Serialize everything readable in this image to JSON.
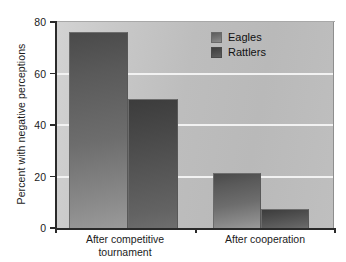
{
  "chart_data": {
    "type": "bar",
    "title": "",
    "xlabel": "",
    "ylabel": "Percent with negative perceptions",
    "ylim": [
      0,
      80
    ],
    "yticks": [
      0,
      20,
      40,
      60,
      80
    ],
    "ytick_labels": [
      "0",
      "20",
      "40",
      "60",
      "80"
    ],
    "grid": "horizontal",
    "legend_position": "upper-right",
    "categories": [
      "After competitive tournament",
      "After cooperation"
    ],
    "category_lines": [
      [
        "After competitive",
        "tournament"
      ],
      [
        "After cooperation"
      ]
    ],
    "series": [
      {
        "name": "Eagles",
        "values": [
          76,
          21.5
        ],
        "color": "#6d6d6d"
      },
      {
        "name": "Rattlers",
        "values": [
          50,
          7.5
        ],
        "color": "#4a4a4a"
      }
    ],
    "bars": [
      {
        "series": "Eagles",
        "category": "After competitive tournament",
        "value": 76
      },
      {
        "series": "Rattlers",
        "category": "After competitive tournament",
        "value": 50
      },
      {
        "series": "Eagles",
        "category": "After cooperation",
        "value": 21.5
      },
      {
        "series": "Rattlers",
        "category": "After cooperation",
        "value": 7.5
      }
    ]
  },
  "legend": {
    "items": [
      {
        "label": "Eagles",
        "swatch": "eagles"
      },
      {
        "label": "Rattlers",
        "swatch": "rattlers"
      }
    ]
  },
  "colors": {
    "plot_background": "#c2c2c2",
    "gridline": "#f2f2f2",
    "axis": "#2a2a2a",
    "eagles_bar": "#6d6d6d",
    "rattlers_bar": "#4a4a4a",
    "page_background": "#ffffff"
  }
}
